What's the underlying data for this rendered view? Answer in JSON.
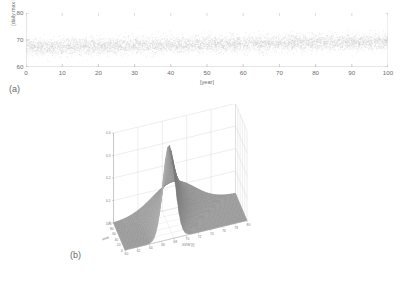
{
  "figure": {
    "background": "#ffffff",
    "text_color": "#6e6e6e"
  },
  "panel_a": {
    "tag": "(a)",
    "xlabel": "[year]",
    "ylabel": "[daily max GVW]",
    "xticks": [
      "0",
      "10",
      "20",
      "30",
      "40",
      "50",
      "60",
      "70",
      "80",
      "90",
      "100"
    ],
    "yticks": [
      "60",
      "70",
      "80"
    ],
    "marker_color": "#c9c9c9"
  },
  "panel_b": {
    "tag": "(b)",
    "xlabel": "GVW [t]",
    "ylabel": "Year",
    "xticks": [
      "60",
      "62",
      "64",
      "66",
      "68",
      "70",
      "72",
      "74",
      "76",
      "78",
      "80"
    ],
    "yticks": [
      "100",
      "80",
      "60",
      "40",
      "20",
      "0"
    ],
    "zticks": [
      "0.4",
      "0.3",
      "0.2",
      "0.1",
      "0"
    ],
    "surface_dark": "#6f6f6f",
    "surface_light": "#b4b4b4",
    "grid_color": "#d8d8d8"
  },
  "chart_data": [
    {
      "type": "scatter",
      "panel": "(a)",
      "title": "",
      "xlabel": "[year]",
      "ylabel": "[daily max GVW]",
      "xlim": [
        0,
        100
      ],
      "ylim": [
        60,
        80
      ],
      "xticks": [
        0,
        10,
        20,
        30,
        40,
        50,
        60,
        70,
        80,
        90,
        100
      ],
      "yticks": [
        60,
        70,
        80
      ],
      "grid": false,
      "description": "Dense cloud of ~36500 light-grey dots (daily maxima of gross vehicle weight over 100 years). Cloud is centred near 68-69 with most points between 64 and 73; a slight upward drift of the mean (about 67.5 at year 0 rising to about 69.5 at year 100) and a few sparse outliers reaching 75-76.",
      "series": [
        {
          "name": "daily max GVW",
          "marker": "dot",
          "color": "#c9c9c9",
          "n_points": 36500,
          "mean_trend": {
            "x": [
              0,
              25,
              50,
              75,
              100
            ],
            "y": [
              67.5,
              68.0,
              68.6,
              69.1,
              69.5
            ]
          },
          "spread_band": {
            "lower": 64.0,
            "upper": 73.0
          },
          "outlier_max": 76.0,
          "outlier_min": 62.5
        }
      ]
    },
    {
      "type": "surface",
      "panel": "(b)",
      "title": "",
      "xlabel": "GVW [t]",
      "ylabel": "Year",
      "zlabel": "",
      "xlim": [
        60,
        80
      ],
      "ylim": [
        0,
        100
      ],
      "zlim": [
        0,
        0.4
      ],
      "xticks": [
        60,
        62,
        64,
        66,
        68,
        70,
        72,
        74,
        76,
        78,
        80
      ],
      "yticks": [
        0,
        20,
        40,
        60,
        80,
        100
      ],
      "zticks": [
        0,
        0.1,
        0.2,
        0.3,
        0.4
      ],
      "grid": true,
      "colormap": "grey",
      "description": "3-D probability-density surface of daily maximum GVW versus year. A single ridge runs along the Year axis; the ridge crest stays near GVW = 67-70 and its peak density falls from about 0.42 at Year 0 to about 0.12 at Year 100, i.e. the distribution flattens and shifts slightly to heavier weights over time.",
      "ridge": [
        {
          "year": 0,
          "peak_gvw": 67.2,
          "peak_density": 0.42
        },
        {
          "year": 20,
          "peak_gvw": 67.8,
          "peak_density": 0.33
        },
        {
          "year": 40,
          "peak_gvw": 68.3,
          "peak_density": 0.26
        },
        {
          "year": 60,
          "peak_gvw": 68.8,
          "peak_density": 0.2
        },
        {
          "year": 80,
          "peak_gvw": 69.3,
          "peak_density": 0.15
        },
        {
          "year": 100,
          "peak_gvw": 69.8,
          "peak_density": 0.12
        }
      ]
    }
  ]
}
